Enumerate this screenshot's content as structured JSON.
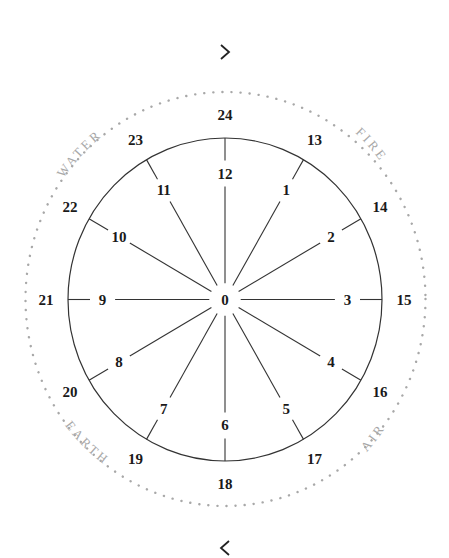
{
  "navigation": {
    "next_icon": "chevron-right-icon",
    "prev_icon": "chevron-left-icon"
  },
  "wheel": {
    "center_label": "0",
    "spokes": [
      {
        "inner": "12",
        "outer": "24",
        "angle": 0
      },
      {
        "inner": "1",
        "outer": "13",
        "angle": 30
      },
      {
        "inner": "2",
        "outer": "14",
        "angle": 60
      },
      {
        "inner": "3",
        "outer": "15",
        "angle": 90
      },
      {
        "inner": "4",
        "outer": "16",
        "angle": 120
      },
      {
        "inner": "5",
        "outer": "17",
        "angle": 150
      },
      {
        "inner": "6",
        "outer": "18",
        "angle": 180
      },
      {
        "inner": "7",
        "outer": "19",
        "angle": 210
      },
      {
        "inner": "8",
        "outer": "20",
        "angle": 240
      },
      {
        "inner": "9",
        "outer": "21",
        "angle": 270
      },
      {
        "inner": "10",
        "outer": "22",
        "angle": 300
      },
      {
        "inner": "11",
        "outer": "23",
        "angle": 330
      }
    ],
    "elements": [
      {
        "label": "WATER",
        "position": "upper-left"
      },
      {
        "label": "FIRE",
        "position": "upper-right"
      },
      {
        "label": "AIR",
        "position": "lower-right"
      },
      {
        "label": "EARTH",
        "position": "lower-left"
      }
    ],
    "colors": {
      "line": "#333333",
      "text": "#1a1a1a",
      "dots": "#a8a8a8",
      "element_text": "#a8a8a8"
    }
  }
}
